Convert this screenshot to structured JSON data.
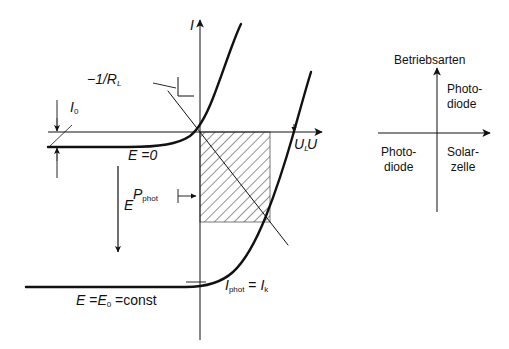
{
  "figure": {
    "type": "diagram",
    "background": "#ffffff",
    "ink": "#111111"
  },
  "left_panel": {
    "axes": {
      "x_label": "U",
      "y_label": "I",
      "origin_px": [
        200,
        132
      ],
      "x_axis_from_px": [
        48,
        132
      ],
      "x_axis_to_px": [
        330,
        132
      ],
      "y_axis_from_px": [
        200,
        340
      ],
      "y_axis_to_px": [
        200,
        14
      ]
    },
    "curves": [
      {
        "name": "dark-characteristic",
        "label": "",
        "saturation_label": "I_0",
        "note": "Dunkelkennlinie, Sättigungsstrom I0 unterhalb der U-Achse"
      },
      {
        "name": "illuminated-E0",
        "label": "E = 0",
        "label_html": "E =0"
      },
      {
        "name": "illuminated-Econst",
        "label": "E = E0 = const",
        "label_html": "E =E0 =const"
      }
    ],
    "annotations": {
      "i0": {
        "text": "I0",
        "base": "I",
        "sub": "0"
      },
      "load_line": {
        "text": "-1/RL",
        "base": "−1/R",
        "sub": "L"
      },
      "e_field_arrow": {
        "text": "E"
      },
      "e_zero": {
        "text": "E =0"
      },
      "e_const": {
        "text": "E =E0 =const"
      },
      "p_phot": {
        "base": "P",
        "sub": "phot"
      },
      "u_l": {
        "base": "U",
        "sub": "L"
      },
      "i_phot": {
        "base": "I",
        "sub": "phot",
        "eq": "=",
        "base2": "I",
        "sub2": "k"
      },
      "axis_i": {
        "text": "I"
      },
      "axis_u": {
        "text": "U"
      }
    },
    "hatched_region": {
      "name": "P_phot",
      "x_px": [
        200,
        270
      ],
      "y_px": [
        132,
        222
      ],
      "hatch_angle_deg": 45,
      "hatch_spacing_px": 5
    }
  },
  "right_panel": {
    "title": "Betriebsarten",
    "axes": {
      "origin_px": [
        437,
        133
      ],
      "x_axis_from_px": [
        378,
        133
      ],
      "x_axis_to_px": [
        497,
        133
      ],
      "y_axis_from_px": [
        437,
        212
      ],
      "y_axis_to_px": [
        437,
        62
      ]
    },
    "quadrants": [
      {
        "position": "upper-right",
        "line1": "Photo-",
        "line2": "diode"
      },
      {
        "position": "lower-left",
        "line1": "Photo-",
        "line2": "diode"
      },
      {
        "position": "lower-right",
        "line1": "Solar-",
        "line2": "zelle"
      }
    ]
  }
}
